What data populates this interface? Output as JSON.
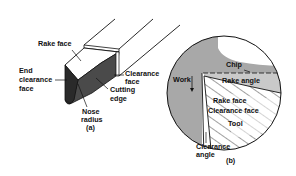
{
  "figure_a": {
    "caption": "(a)",
    "labels": {
      "rake_face": "Rake face",
      "end_clearance_1": "End",
      "end_clearance_2": "clearance",
      "end_clearance_3": "face",
      "clearance_face_1": "Clearance",
      "clearance_face_2": "face",
      "cutting_edge_1": "Cutting",
      "cutting_edge_2": "edge",
      "nose_radius_1": "Nose",
      "nose_radius_2": "radius"
    }
  },
  "figure_b": {
    "caption": "(b)",
    "labels": {
      "chip": "Chip",
      "work": "Work",
      "rake_angle": "Rake angle",
      "rake_face": "Rake face",
      "clearance_face": "Clearance face",
      "tool": "Tool",
      "clearance_angle_1": "Clearance",
      "clearance_angle_2": "angle"
    }
  },
  "colors": {
    "ink": "#111111",
    "dark_face": "#3a3a3a",
    "work_gray": "#a8a8a8",
    "chip_gray": "#c4c4c4"
  }
}
